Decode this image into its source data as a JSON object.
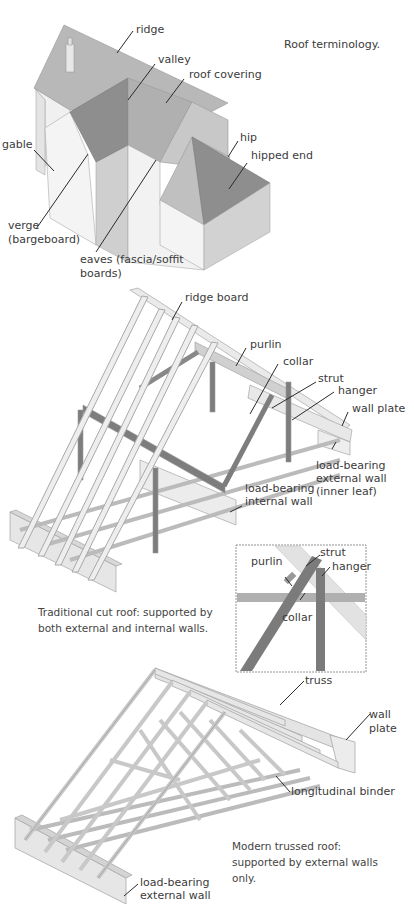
{
  "figures": {
    "roof_terminology": {
      "caption": "Roof terminology.",
      "labels": {
        "ridge": "ridge",
        "valley": "valley",
        "roof_covering": "roof covering",
        "gable": "gable",
        "hip": "hip",
        "hipped_end": "hipped end",
        "verge_1": "verge",
        "verge_2": "(bargeboard)",
        "eaves_1": "eaves (fascia/soffit",
        "eaves_2": "boards)"
      }
    },
    "traditional_cut_roof": {
      "caption_1": "Traditional cut roof: supported by",
      "caption_2": "both external and internal walls.",
      "labels": {
        "ridge_board": "ridge board",
        "purlin": "purlin",
        "collar": "collar",
        "strut": "strut",
        "hanger": "hanger",
        "wall_plate": "wall plate",
        "ext_wall_1": "load-bearing",
        "ext_wall_2": "external wall",
        "ext_wall_3": "(inner leaf)",
        "int_wall_1": "load-bearing",
        "int_wall_2": "internal wall"
      },
      "inset_labels": {
        "purlin": "purlin",
        "strut": "strut",
        "hanger": "hanger",
        "collar": "collar"
      }
    },
    "modern_trussed_roof": {
      "caption_1": "Modern trussed roof:",
      "caption_2": "supported by external walls",
      "caption_3": "only.",
      "labels": {
        "truss": "truss",
        "wall_plate_1": "wall",
        "wall_plate_2": "plate",
        "longitudinal_binder": "longitudinal binder",
        "ext_wall_1": "load-bearing",
        "ext_wall_2": "external wall"
      }
    }
  },
  "colors": {
    "roof_light": "#b4b4b4",
    "roof_dark": "#8c8c8c",
    "wall_light": "#f2f2f2",
    "wall_shade": "#d6d6d6",
    "timber": "#e6e6e6",
    "timber_dark": "#808080",
    "leader": "#2a2a2a"
  }
}
